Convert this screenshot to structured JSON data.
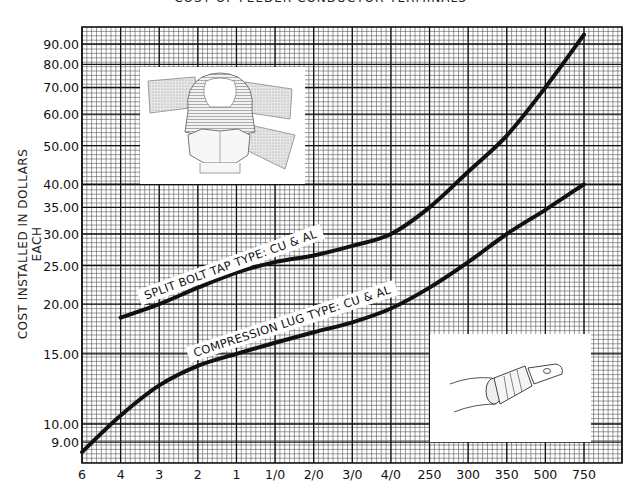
{
  "chart_data": {
    "type": "line",
    "title": "COST OF FEEDER CONDUCTOR TERMINALS",
    "xlabel": "",
    "ylabel": "COST INSTALLED IN DOLLARS EACH",
    "yscale": "log",
    "ylim": [
      8,
      100
    ],
    "grid": true,
    "categories": [
      "6",
      "4",
      "3",
      "2",
      "1",
      "1/0",
      "2/0",
      "3/0",
      "4/0",
      "250",
      "300",
      "350",
      "500",
      "750"
    ],
    "y_ticks": [
      "90.00",
      "80.00",
      "70.00",
      "60.00",
      "50.00",
      "40.00",
      "35.00",
      "30.00",
      "25.00",
      "20.00",
      "15.00",
      "10.00",
      "9.00"
    ],
    "series": [
      {
        "name": "SPLIT BOLT TAP TYPE:  CU & AL",
        "values": [
          null,
          18.5,
          20,
          22,
          24,
          25.5,
          26.5,
          28,
          30,
          35,
          43,
          53,
          70,
          95
        ]
      },
      {
        "name": "COMPRESSION LUG TYPE:  CU & AL",
        "values": [
          8.5,
          10.5,
          12.5,
          14,
          15,
          16,
          17,
          18,
          19.5,
          22,
          25.5,
          30,
          34.5,
          40
        ]
      }
    ],
    "annotations": [
      "split-bolt-tap-illustration",
      "compression-lug-illustration"
    ]
  },
  "labels": {
    "title": "COST OF FEEDER CONDUCTOR TERMINALS",
    "ylabel": "COST INSTALLED IN DOLLARS EACH",
    "split_bolt": "SPLIT BOLT TAP TYPE:  CU & AL",
    "compression": "COMPRESSION LUG TYPE:  CU & AL"
  },
  "colors": {
    "grid": "#222222",
    "curve": "#111111",
    "background": "#ffffff"
  }
}
